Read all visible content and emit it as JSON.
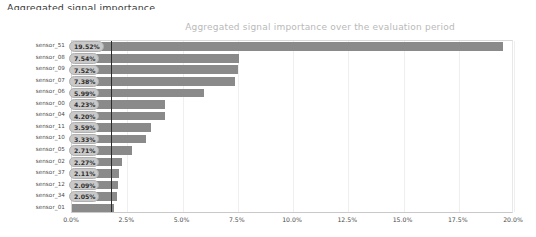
{
  "page": {
    "caption": "Aggregated signal importance"
  },
  "chart_data": {
    "type": "bar",
    "orientation": "horizontal",
    "title": "Aggregated signal importance over the evaluation period",
    "xlabel": "",
    "ylabel": "",
    "xlim": [
      0,
      20
    ],
    "xticks": [
      "0.0%",
      "2.5%",
      "5.0%",
      "7.5%",
      "10.0%",
      "12.5%",
      "15.0%",
      "17.5%",
      "20.0%"
    ],
    "xtick_values": [
      0,
      2.5,
      5,
      7.5,
      10,
      12.5,
      15,
      17.5,
      20
    ],
    "grid": false,
    "legend": "none",
    "reference_line": 1.75,
    "bar_color": "#8a8a8a",
    "categories": [
      "sensor_51",
      "sensor_08",
      "sensor_09",
      "sensor_07",
      "sensor_06",
      "sensor_00",
      "sensor_04",
      "sensor_11",
      "sensor_10",
      "sensor_05",
      "sensor_02",
      "sensor_37",
      "sensor_12",
      "sensor_34",
      "sensor_01"
    ],
    "values": [
      19.52,
      7.54,
      7.52,
      7.38,
      5.99,
      4.23,
      4.2,
      3.59,
      3.33,
      2.71,
      2.27,
      2.11,
      2.09,
      2.05,
      1.9
    ],
    "labels": [
      "19.52%",
      "7.54%",
      "7.52%",
      "7.38%",
      "5.99%",
      "4.23%",
      "4.20%",
      "3.59%",
      "3.33%",
      "2.71%",
      "2.27%",
      "2.11%",
      "2.09%",
      "2.05%",
      ""
    ]
  }
}
